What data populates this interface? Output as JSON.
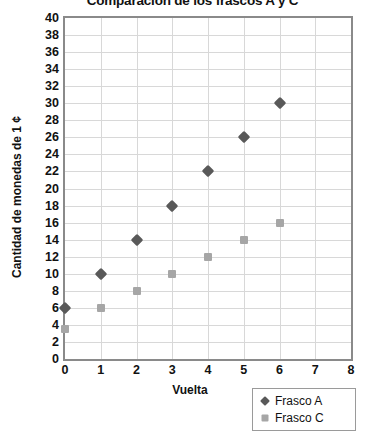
{
  "chart_data": {
    "type": "scatter",
    "title": "Comparación de los frascos A y C",
    "xlabel": "Vuelta",
    "ylabel": "Cantidad de monedas de 1 ¢",
    "x": [
      0,
      1,
      2,
      3,
      4,
      5,
      6
    ],
    "series": [
      {
        "name": "Frasco A",
        "marker": "diamond",
        "color": "#595959",
        "values": [
          6,
          10,
          14,
          18,
          22,
          26,
          30
        ]
      },
      {
        "name": "Frasco C",
        "marker": "square",
        "color": "#a6a6a6",
        "values": [
          3.5,
          6,
          8,
          10,
          12,
          14,
          16
        ]
      }
    ],
    "xlim": [
      0,
      8
    ],
    "ylim": [
      0,
      40
    ],
    "xticks": [
      "0",
      "1",
      "2",
      "3",
      "4",
      "5",
      "6",
      "7",
      "8"
    ],
    "yticks": [
      "0",
      "2",
      "4",
      "6",
      "8",
      "10",
      "12",
      "14",
      "16",
      "18",
      "20",
      "22",
      "24",
      "26",
      "28",
      "30",
      "32",
      "34",
      "36",
      "38",
      "40"
    ],
    "grid": true,
    "legend_position": "bottom-right",
    "legend_entries": [
      {
        "label": "Frasco A",
        "marker": "diamond"
      },
      {
        "label": "Frasco C",
        "marker": "square"
      }
    ]
  }
}
